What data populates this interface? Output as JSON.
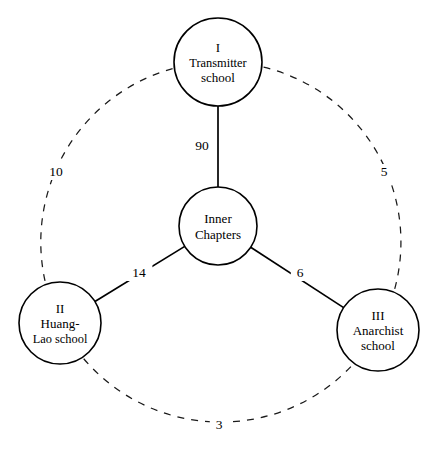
{
  "diagram": {
    "type": "node-link-graph",
    "background_color": "#ffffff",
    "line_color": "#000000",
    "nodes": [
      {
        "id": "inner-chapters",
        "lines": [
          "Inner",
          "Chapters"
        ],
        "numeral": "",
        "cx": 218,
        "cy": 226,
        "r": 39,
        "role": "center"
      },
      {
        "id": "transmitter-school",
        "lines": [
          "I",
          "Transmitter",
          "school"
        ],
        "numeral": "I",
        "cx": 218,
        "cy": 62,
        "r": 44,
        "role": "outer-top"
      },
      {
        "id": "huang-lao-school",
        "lines": [
          "II",
          "Huang-",
          "Lao school"
        ],
        "numeral": "II",
        "cx": 60,
        "cy": 323,
        "r": 41,
        "role": "outer-bottom-left"
      },
      {
        "id": "anarchist-school",
        "lines": [
          "III",
          "Anarchist",
          "school"
        ],
        "numeral": "III",
        "cx": 378,
        "cy": 330,
        "r": 41,
        "role": "outer-bottom-right"
      }
    ],
    "solid_edges": [
      {
        "id": "inner-to-transmitter",
        "source": "inner-chapters",
        "target": "transmitter-school",
        "weight": "90",
        "label_x": 202,
        "label_y": 150
      },
      {
        "id": "inner-to-huang-lao",
        "source": "inner-chapters",
        "target": "huang-lao-school",
        "weight": "14",
        "label_x": 139,
        "label_y": 277
      },
      {
        "id": "inner-to-anarchist",
        "source": "inner-chapters",
        "target": "anarchist-school",
        "weight": "6",
        "label_x": 300,
        "label_y": 277
      }
    ],
    "dashed_edges": [
      {
        "id": "transmitter-to-huang-lao",
        "source": "transmitter-school",
        "target": "huang-lao-school",
        "weight": "10",
        "label_x": 56,
        "label_y": 176
      },
      {
        "id": "transmitter-to-anarchist",
        "source": "transmitter-school",
        "target": "anarchist-school",
        "weight": "5",
        "label_x": 384,
        "label_y": 176
      },
      {
        "id": "huang-lao-to-anarchist",
        "source": "huang-lao-school",
        "target": "anarchist-school",
        "weight": "3",
        "label_x": 219,
        "label_y": 429
      }
    ]
  },
  "chart_data": {
    "type": "diagram",
    "title": "",
    "nodes": [
      "Inner Chapters",
      "I Transmitter school",
      "II Huang-Lao school",
      "III Anarchist school"
    ],
    "edges": [
      {
        "from": "Inner Chapters",
        "to": "I Transmitter school",
        "value": 90,
        "style": "solid"
      },
      {
        "from": "Inner Chapters",
        "to": "II Huang-Lao school",
        "value": 14,
        "style": "solid"
      },
      {
        "from": "Inner Chapters",
        "to": "III Anarchist school",
        "value": 6,
        "style": "solid"
      },
      {
        "from": "I Transmitter school",
        "to": "II Huang-Lao school",
        "value": 10,
        "style": "dashed"
      },
      {
        "from": "I Transmitter school",
        "to": "III Anarchist school",
        "value": 5,
        "style": "dashed"
      },
      {
        "from": "II Huang-Lao school",
        "to": "III Anarchist school",
        "value": 3,
        "style": "dashed"
      }
    ]
  }
}
